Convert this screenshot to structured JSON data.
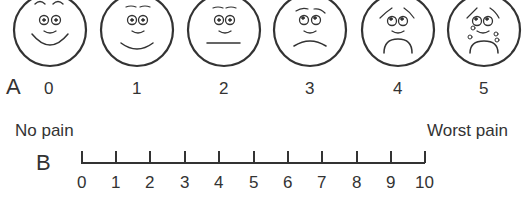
{
  "scale_a": {
    "label": "A",
    "faces": [
      {
        "value": "0",
        "expression": "very-happy"
      },
      {
        "value": "1",
        "expression": "happy"
      },
      {
        "value": "2",
        "expression": "neutral"
      },
      {
        "value": "3",
        "expression": "sad"
      },
      {
        "value": "4",
        "expression": "very-sad"
      },
      {
        "value": "5",
        "expression": "crying"
      }
    ]
  },
  "scale_b": {
    "label": "B",
    "left_anchor": "No pain",
    "right_anchor": "Worst pain",
    "ticks": [
      "0",
      "1",
      "2",
      "3",
      "4",
      "5",
      "6",
      "7",
      "8",
      "9",
      "10"
    ]
  }
}
